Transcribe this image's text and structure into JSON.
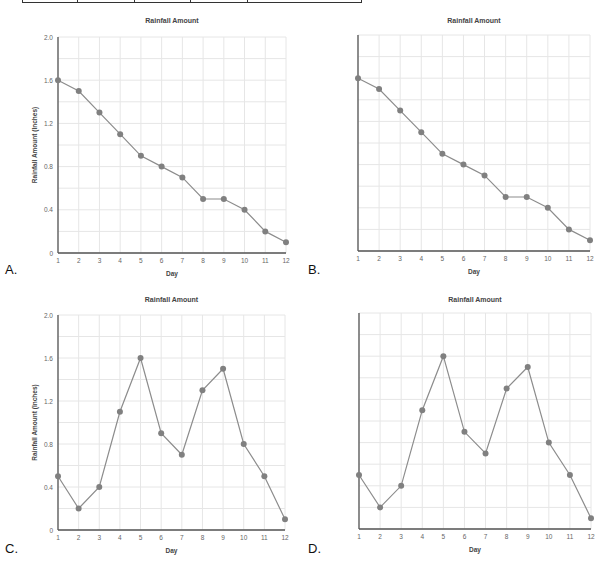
{
  "options": [
    {
      "letter": "A.",
      "show_y_labels": true,
      "show_title": true
    },
    {
      "letter": "B.",
      "show_y_labels": false,
      "show_title": true
    },
    {
      "letter": "C.",
      "show_y_labels": true,
      "show_title": true
    },
    {
      "letter": "D.",
      "show_y_labels": false,
      "show_title": true
    }
  ],
  "colors": {
    "line": "#8c8c8c",
    "marker": "#808080",
    "grid": "#e6e6e6",
    "axis": "#555555",
    "text": "#444444"
  },
  "chart_data": [
    {
      "type": "line",
      "option": "A",
      "title": "Rainfall Amount",
      "xlabel": "Day",
      "ylabel": "Rainfall Amount (Inches)",
      "x": [
        1,
        2,
        3,
        4,
        5,
        6,
        7,
        8,
        9,
        10,
        11,
        12
      ],
      "series": [
        {
          "name": "Rainfall",
          "values": [
            1.6,
            1.5,
            1.3,
            1.1,
            0.9,
            0.8,
            0.7,
            0.5,
            0.5,
            0.4,
            0.2,
            0.1
          ]
        }
      ],
      "yticks": [
        "0",
        "0.4",
        "0.8",
        "1.2",
        "1.6",
        "2.0"
      ],
      "xticks": [
        "1",
        "2",
        "3",
        "4",
        "5",
        "6",
        "7",
        "8",
        "9",
        "10",
        "11",
        "12"
      ],
      "ylim": [
        0,
        2.0
      ],
      "grid": true
    },
    {
      "type": "line",
      "option": "B",
      "title": "Rainfall Amount",
      "xlabel": "Day",
      "ylabel": "",
      "x": [
        1,
        2,
        3,
        4,
        5,
        6,
        7,
        8,
        9,
        10,
        11,
        12
      ],
      "series": [
        {
          "name": "Rainfall",
          "values": [
            1.6,
            1.5,
            1.3,
            1.1,
            0.9,
            0.8,
            0.7,
            0.5,
            0.5,
            0.4,
            0.2,
            0.1
          ]
        }
      ],
      "yticks": [],
      "xticks": [
        "1",
        "2",
        "3",
        "4",
        "5",
        "6",
        "7",
        "8",
        "9",
        "10",
        "11",
        "12"
      ],
      "ylim": [
        0,
        2.0
      ],
      "grid": true
    },
    {
      "type": "line",
      "option": "C",
      "title": "Rainfall Amount",
      "xlabel": "Day",
      "ylabel": "Rainfall Amount (Inches)",
      "x": [
        1,
        2,
        3,
        4,
        5,
        6,
        7,
        8,
        9,
        10,
        11,
        12
      ],
      "series": [
        {
          "name": "Rainfall",
          "values": [
            0.5,
            0.2,
            0.4,
            1.1,
            1.6,
            0.9,
            0.7,
            1.3,
            1.5,
            0.8,
            0.5,
            0.1
          ]
        }
      ],
      "yticks": [
        "0",
        "0.4",
        "0.8",
        "1.2",
        "1.6",
        "2.0"
      ],
      "xticks": [
        "1",
        "2",
        "3",
        "4",
        "5",
        "6",
        "7",
        "8",
        "9",
        "10",
        "11",
        "12"
      ],
      "ylim": [
        0,
        2.0
      ],
      "grid": true
    },
    {
      "type": "line",
      "option": "D",
      "title": "Rainfall Amount",
      "xlabel": "Day",
      "ylabel": "",
      "x": [
        1,
        2,
        3,
        4,
        5,
        6,
        7,
        8,
        9,
        10,
        11,
        12
      ],
      "series": [
        {
          "name": "Rainfall",
          "values": [
            0.5,
            0.2,
            0.4,
            1.1,
            1.6,
            0.9,
            0.7,
            1.3,
            1.5,
            0.8,
            0.5,
            0.1
          ]
        }
      ],
      "yticks": [],
      "xticks": [
        "1",
        "2",
        "3",
        "4",
        "5",
        "6",
        "7",
        "8",
        "9",
        "10",
        "11",
        "12"
      ],
      "ylim": [
        0,
        2.0
      ],
      "grid": true
    }
  ]
}
